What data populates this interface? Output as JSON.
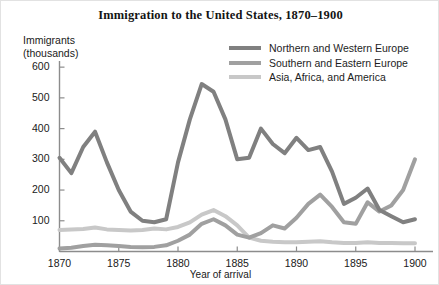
{
  "chart_data": {
    "type": "line",
    "title": "Immigration to the United States, 1870–1900",
    "xlabel": "Year of arrival",
    "ylabel": "Immigrants\n(thousands)",
    "xlim": [
      1870,
      1900
    ],
    "ylim": [
      0,
      620
    ],
    "grid": false,
    "legend_position": "top-right",
    "x_ticks": [
      "1870",
      "1875",
      "1880",
      "1885",
      "1890",
      "1895",
      "1900"
    ],
    "x_tick_values": [
      1870,
      1875,
      1880,
      1885,
      1890,
      1895,
      1900
    ],
    "y_ticks": [
      "100",
      "200",
      "300",
      "400",
      "500",
      "600"
    ],
    "y_tick_values": [
      100,
      200,
      300,
      400,
      500,
      600
    ],
    "x": [
      1870,
      1871,
      1872,
      1873,
      1874,
      1875,
      1876,
      1877,
      1878,
      1879,
      1880,
      1881,
      1882,
      1883,
      1884,
      1885,
      1886,
      1887,
      1888,
      1889,
      1890,
      1891,
      1892,
      1893,
      1894,
      1895,
      1896,
      1897,
      1898,
      1899,
      1900
    ],
    "series": [
      {
        "name": "Northern and Western Europe",
        "color": "#808080",
        "values": [
          305,
          255,
          340,
          390,
          290,
          200,
          130,
          100,
          95,
          105,
          290,
          430,
          545,
          520,
          430,
          300,
          305,
          400,
          350,
          320,
          370,
          330,
          340,
          260,
          155,
          175,
          205,
          135,
          115,
          95,
          105
        ]
      },
      {
        "name": "Southern and Eastern Europe",
        "color": "#a0a0a0",
        "values": [
          10,
          12,
          18,
          22,
          20,
          18,
          15,
          14,
          15,
          20,
          35,
          55,
          90,
          105,
          85,
          55,
          45,
          60,
          85,
          75,
          110,
          155,
          185,
          145,
          95,
          90,
          160,
          130,
          150,
          200,
          300
        ]
      },
      {
        "name": "Asia, Africa, and America",
        "color": "#c8c8c8",
        "values": [
          70,
          72,
          73,
          78,
          72,
          70,
          68,
          70,
          75,
          72,
          80,
          95,
          120,
          135,
          115,
          85,
          45,
          35,
          32,
          30,
          30,
          32,
          33,
          30,
          28,
          28,
          30,
          28,
          28,
          27,
          27
        ]
      }
    ]
  },
  "legend": [
    {
      "label": "Northern and Western Europe",
      "color": "#808080"
    },
    {
      "label": "Southern and Eastern Europe",
      "color": "#a0a0a0"
    },
    {
      "label": "Asia, Africa, and America",
      "color": "#c8c8c8"
    }
  ],
  "axis": {
    "color": "#8c8c8c"
  }
}
